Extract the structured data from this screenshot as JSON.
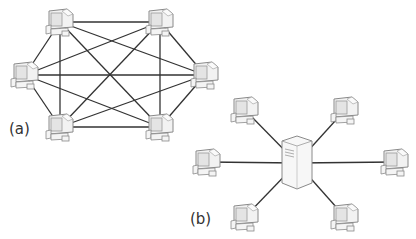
{
  "diagram": {
    "panels": [
      {
        "id": "a",
        "label": "(a)",
        "topology": "mesh",
        "description": "Six computers, each connected to every other computer (fully connected mesh)",
        "nodes": [
          {
            "type": "computer",
            "x": 60,
            "y": 22
          },
          {
            "type": "computer",
            "x": 160,
            "y": 22
          },
          {
            "type": "computer",
            "x": 25,
            "y": 75
          },
          {
            "type": "computer",
            "x": 205,
            "y": 75
          },
          {
            "type": "computer",
            "x": 60,
            "y": 127
          },
          {
            "type": "computer",
            "x": 160,
            "y": 127
          }
        ]
      },
      {
        "id": "b",
        "label": "(b)",
        "topology": "star",
        "description": "Six computers connected to a central server (client-server / star)",
        "server": {
          "type": "server",
          "x": 297,
          "y": 163
        },
        "nodes": [
          {
            "type": "computer",
            "x": 245,
            "y": 110
          },
          {
            "type": "computer",
            "x": 345,
            "y": 110
          },
          {
            "type": "computer",
            "x": 207,
            "y": 162
          },
          {
            "type": "computer",
            "x": 395,
            "y": 162
          },
          {
            "type": "computer",
            "x": 245,
            "y": 217
          },
          {
            "type": "computer",
            "x": 345,
            "y": 217
          }
        ]
      }
    ],
    "colors": {
      "line": "#333333",
      "device_stroke": "#8a8a8a",
      "device_fill": "#f2f2f2"
    }
  }
}
